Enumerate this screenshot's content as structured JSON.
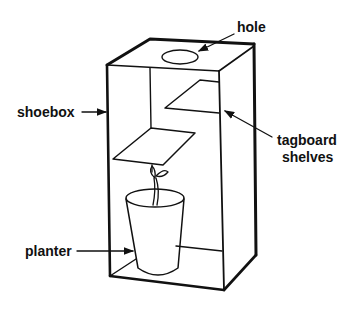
{
  "diagram": {
    "type": "labeled illustration",
    "labels": {
      "hole": "hole",
      "shoebox": "shoebox",
      "shelves_line1": "tagboard",
      "shelves_line2": "shelves",
      "planter": "planter"
    },
    "colors": {
      "ink": "#111111",
      "background": "#ffffff"
    }
  }
}
